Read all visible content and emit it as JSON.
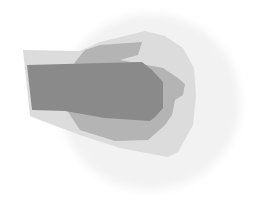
{
  "diagram": {
    "type": "nested-regions",
    "background": "#ffffff",
    "regions": [
      {
        "id": "outer-halo",
        "level": 0,
        "fill": "#f2f2f2",
        "shape": "ellipse",
        "cx": 150,
        "cy": 102,
        "rx": 90,
        "ry": 88
      },
      {
        "id": "light-region",
        "level": 1,
        "fill": "#dcdcdc",
        "points": "23,50 80,51 100,42 145,31 165,36 183,48 194,68 196,95 193,125 178,152 168,157 120,148 80,135 40,120 30,116"
      },
      {
        "id": "medium-region",
        "level": 2,
        "fill": "#b4b4b4",
        "points": "75,62 85,50 100,45 142,42 138,55 120,60 163,68 178,78 185,84 183,95 175,100 172,115 165,125 148,140 115,141 80,130 70,115 60,100"
      },
      {
        "id": "dark-region",
        "level": 3,
        "fill": "#8a8a8a",
        "points": "27,65 142,62 152,70 163,82 163,108 155,117 150,121 105,118 65,111 32,110"
      }
    ]
  }
}
